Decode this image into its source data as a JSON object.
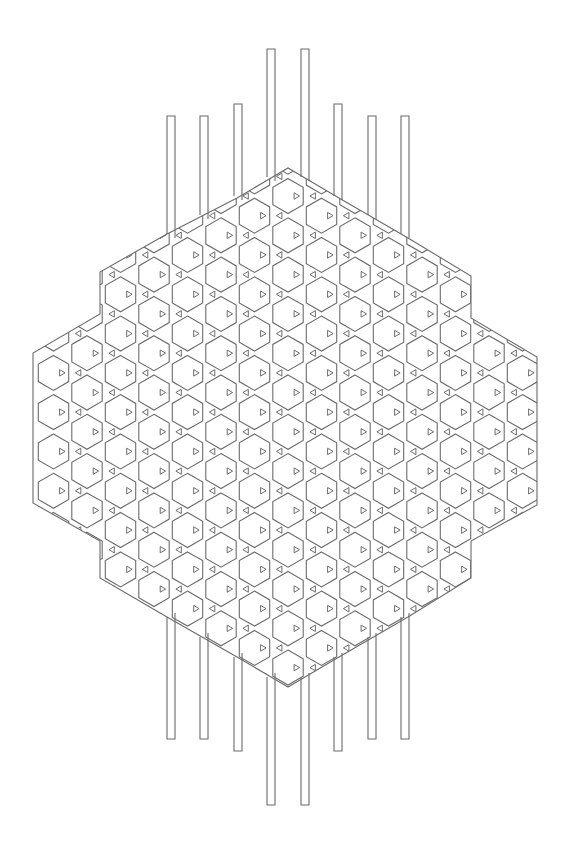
{
  "figure": {
    "title": "Kagome weave pattern (hexagons and triangles) with protruding strips",
    "type": "line-drawing",
    "stroke_color": "#6b6b6b",
    "background": "#ffffff",
    "stroke_width": 1.1
  },
  "lattice": {
    "column_spacing": 33.5,
    "row_spacing": 39.3,
    "center_column_x": 288,
    "center_hex_y": 196,
    "hex_radius": 17.5,
    "triangle_size": 5.2,
    "column_range": [
      -7,
      7
    ],
    "row_range": [
      -2,
      14
    ]
  },
  "outline": {
    "points": [
      [
        167,
        234
      ],
      [
        100,
        272
      ],
      [
        100,
        314
      ],
      [
        33,
        353
      ],
      [
        33,
        503
      ],
      [
        100,
        541
      ],
      [
        100,
        578
      ],
      [
        167,
        617
      ],
      [
        237,
        657
      ],
      [
        271,
        677
      ],
      [
        288,
        687
      ],
      [
        305,
        677
      ],
      [
        339,
        657
      ],
      [
        408,
        617
      ],
      [
        471,
        578
      ],
      [
        471,
        541
      ],
      [
        537,
        505
      ],
      [
        537,
        357
      ],
      [
        471,
        318
      ],
      [
        471,
        276
      ],
      [
        408,
        238
      ],
      [
        339,
        198
      ],
      [
        305,
        178
      ],
      [
        288,
        168
      ],
      [
        271,
        178
      ],
      [
        237,
        198
      ]
    ]
  },
  "strips": {
    "width": 8,
    "top": [
      {
        "x": 167,
        "top": 116,
        "bottom": 234
      },
      {
        "x": 200,
        "top": 116,
        "bottom": 215
      },
      {
        "x": 234,
        "top": 104,
        "bottom": 196
      },
      {
        "x": 267,
        "top": 49,
        "bottom": 177
      },
      {
        "x": 301,
        "top": 49,
        "bottom": 177
      },
      {
        "x": 334,
        "top": 104,
        "bottom": 196
      },
      {
        "x": 368,
        "top": 116,
        "bottom": 215
      },
      {
        "x": 401,
        "top": 116,
        "bottom": 234
      }
    ],
    "bottom": [
      {
        "x": 167,
        "top": 617,
        "bottom": 739
      },
      {
        "x": 200,
        "top": 637,
        "bottom": 739
      },
      {
        "x": 234,
        "top": 657,
        "bottom": 751
      },
      {
        "x": 267,
        "top": 677,
        "bottom": 805
      },
      {
        "x": 301,
        "top": 677,
        "bottom": 805
      },
      {
        "x": 334,
        "top": 657,
        "bottom": 751
      },
      {
        "x": 368,
        "top": 637,
        "bottom": 739
      },
      {
        "x": 401,
        "top": 617,
        "bottom": 739
      }
    ]
  }
}
